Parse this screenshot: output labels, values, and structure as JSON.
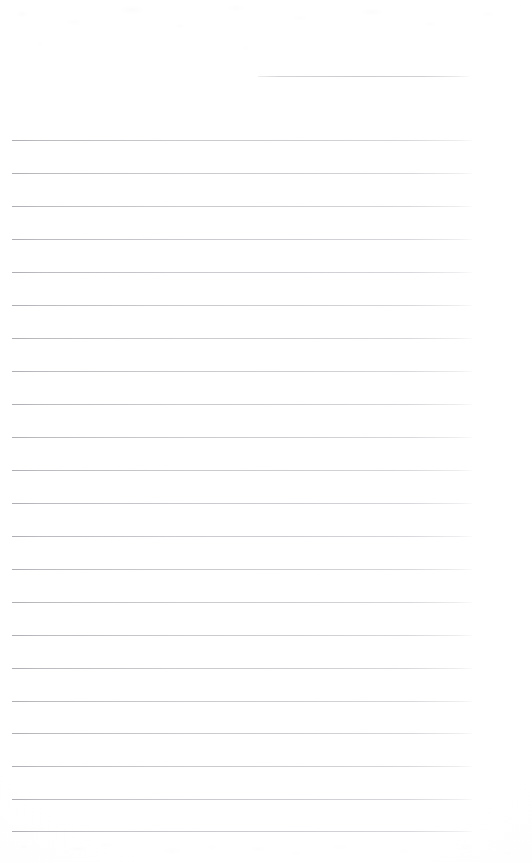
{
  "document": {
    "kind": "scanned-ruled-notebook-page",
    "title": "Blank Lined Paper",
    "page_width": 532,
    "page_height": 863,
    "background_color": "#ffffff",
    "rule_color": "#a8a8b0",
    "has_text_content": false,
    "visible_text": ""
  },
  "header_rule": {
    "label": "",
    "x": 258,
    "y": 76,
    "width": 212,
    "description": "short rule near top right"
  },
  "rules": {
    "count": 22,
    "left_x": 12,
    "right_x": 472,
    "width": 460,
    "first_y": 140,
    "spacing": 33,
    "items": [
      {
        "index": 1,
        "y": 140,
        "label": ""
      },
      {
        "index": 2,
        "y": 173,
        "label": ""
      },
      {
        "index": 3,
        "y": 206,
        "label": ""
      },
      {
        "index": 4,
        "y": 239,
        "label": ""
      },
      {
        "index": 5,
        "y": 272,
        "label": ""
      },
      {
        "index": 6,
        "y": 305,
        "label": ""
      },
      {
        "index": 7,
        "y": 338,
        "label": ""
      },
      {
        "index": 8,
        "y": 371,
        "label": ""
      },
      {
        "index": 9,
        "y": 404,
        "label": ""
      },
      {
        "index": 10,
        "y": 437,
        "label": ""
      },
      {
        "index": 11,
        "y": 470,
        "label": ""
      },
      {
        "index": 12,
        "y": 503,
        "label": ""
      },
      {
        "index": 13,
        "y": 536,
        "label": ""
      },
      {
        "index": 14,
        "y": 569,
        "label": ""
      },
      {
        "index": 15,
        "y": 602,
        "label": ""
      },
      {
        "index": 16,
        "y": 635,
        "label": ""
      },
      {
        "index": 17,
        "y": 668,
        "label": ""
      },
      {
        "index": 18,
        "y": 701,
        "label": ""
      },
      {
        "index": 19,
        "y": 733,
        "label": ""
      },
      {
        "index": 20,
        "y": 766,
        "label": ""
      },
      {
        "index": 21,
        "y": 799,
        "label": ""
      },
      {
        "index": 22,
        "y": 831,
        "label": ""
      }
    ]
  },
  "margins": {
    "top": 140,
    "left": 12,
    "right": 60,
    "bottom": 32
  }
}
